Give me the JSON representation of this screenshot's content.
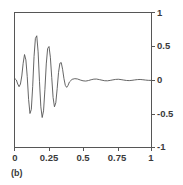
{
  "figure": {
    "caption": "(b)",
    "line_color": "#555555",
    "axis_color": "#565656",
    "background": "#ffffff"
  },
  "chart_data": {
    "type": "line",
    "title": "",
    "subtitle": "",
    "xlabel": "",
    "ylabel": "",
    "annotation": "(b)",
    "grid": false,
    "legend": null,
    "xlim": [
      0,
      1
    ],
    "ylim": [
      -1,
      1
    ],
    "xticks": [
      0,
      0.25,
      0.5,
      0.75,
      1
    ],
    "xticklabels": [
      "0",
      "0.25",
      "0.5",
      "0.75",
      "1"
    ],
    "yticks": [
      1,
      0.5,
      0,
      -0.5,
      -1
    ],
    "yticklabels": [
      "1",
      "0.5",
      "0",
      "-0.5",
      "-1"
    ],
    "yaxis_label_side": "right",
    "series": [
      {
        "name": "waveform",
        "color": "#555555",
        "x": [
          0.0,
          0.01,
          0.02,
          0.03,
          0.04,
          0.05,
          0.06,
          0.07,
          0.08,
          0.09,
          0.1,
          0.11,
          0.12,
          0.13,
          0.14,
          0.15,
          0.16,
          0.17,
          0.18,
          0.19,
          0.2,
          0.21,
          0.22,
          0.23,
          0.24,
          0.25,
          0.26,
          0.27,
          0.28,
          0.29,
          0.3,
          0.31,
          0.32,
          0.33,
          0.34,
          0.35,
          0.36,
          0.37,
          0.38,
          0.39,
          0.4,
          0.42,
          0.44,
          0.46,
          0.48,
          0.5,
          0.52,
          0.54,
          0.56,
          0.58,
          0.6,
          0.62,
          0.64,
          0.66,
          0.68,
          0.7,
          0.72,
          0.74,
          0.76,
          0.78,
          0.8,
          0.82,
          0.84,
          0.86,
          0.88,
          0.9,
          0.92,
          0.94,
          0.96,
          0.98,
          1.0
        ],
        "y": [
          0.02,
          0.0,
          -0.06,
          -0.1,
          -0.06,
          0.06,
          0.25,
          0.38,
          0.3,
          0.05,
          -0.29,
          -0.5,
          -0.44,
          -0.1,
          0.35,
          0.62,
          0.66,
          0.42,
          -0.02,
          -0.4,
          -0.56,
          -0.46,
          -0.14,
          0.24,
          0.47,
          0.5,
          0.34,
          0.04,
          -0.26,
          -0.4,
          -0.34,
          -0.13,
          0.11,
          0.25,
          0.26,
          0.16,
          0.02,
          -0.08,
          -0.11,
          -0.08,
          -0.03,
          0.01,
          0.02,
          0.015,
          0.0,
          -0.012,
          -0.016,
          -0.008,
          0.004,
          0.013,
          0.014,
          0.006,
          -0.003,
          -0.011,
          -0.012,
          -0.006,
          0.002,
          0.009,
          0.011,
          0.006,
          -0.001,
          -0.007,
          -0.009,
          -0.005,
          0.001,
          0.006,
          0.008,
          0.004,
          -0.001,
          -0.005,
          -0.006
        ]
      }
    ]
  }
}
